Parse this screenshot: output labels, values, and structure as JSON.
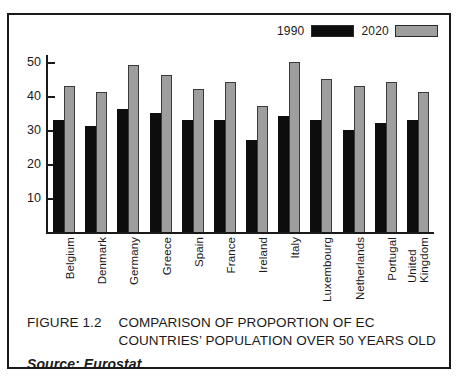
{
  "figure": {
    "caption_number": "FIGURE 1.2",
    "caption_line1": "COMPARISON OF PROPORTION OF EC",
    "caption_line2": "COUNTRIES’ POPULATION OVER 50 YEARS OLD",
    "source": "Source: Eurostat"
  },
  "legend": {
    "entries": [
      {
        "label": "1990",
        "swatch": "#0d0d0d"
      },
      {
        "label": "2020",
        "swatch": "#9e9e9e"
      }
    ]
  },
  "axis": {
    "y_ticks": [
      "50",
      "40",
      "30",
      "20",
      "10"
    ]
  },
  "chart_data": {
    "type": "bar",
    "title": "FIGURE 1.2 COMPARISON OF PROPORTION OF EC COUNTRIES’ POPULATION OVER 50 YEARS OLD",
    "subtitle": "Source: Eurostat",
    "xlabel": "",
    "ylabel": "",
    "ylim": [
      0,
      52
    ],
    "yticks": [
      10,
      20,
      30,
      40,
      50
    ],
    "grid": false,
    "legend_position": "top-right",
    "categories": [
      "Belgium",
      "Denmark",
      "Germany",
      "Greece",
      "Spain",
      "France",
      "Ireland",
      "Italy",
      "Luxembourg",
      "Netherlands",
      "Portugal",
      "United\nKingdom"
    ],
    "series": [
      {
        "name": "1990",
        "color": "#0d0d0d",
        "values": [
          33,
          31,
          36,
          35,
          33,
          33,
          27,
          34,
          33,
          30,
          32,
          33
        ]
      },
      {
        "name": "2020",
        "color": "#9e9e9e",
        "values": [
          43,
          41,
          49,
          46,
          42,
          44,
          37,
          50,
          45,
          43,
          44,
          41
        ]
      }
    ]
  }
}
